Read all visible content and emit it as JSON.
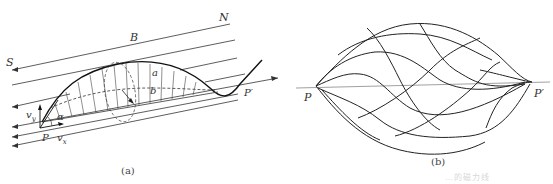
{
  "figure": {
    "panel_a": {
      "caption": "(a)",
      "labels": {
        "north": "N",
        "south": "S",
        "field": "B",
        "a": "a",
        "b": "b",
        "start_point": "P",
        "end_point": "P′",
        "angle": "α",
        "vy": "v",
        "vy_sub": "y",
        "vx": "v",
        "vx_sub": "x"
      }
    },
    "panel_b": {
      "caption": "(b)",
      "labels": {
        "start_point": "P",
        "end_point": "P′"
      }
    },
    "footer_faint_text": "…的磁力线"
  },
  "colors": {
    "line": "#222222",
    "axis": "#888888",
    "background": "#ffffff"
  }
}
